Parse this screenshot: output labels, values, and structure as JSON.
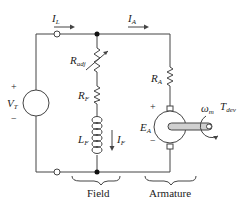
{
  "diagram": {
    "type": "circuit",
    "labels": {
      "line_current": {
        "main": "I",
        "sub": "L"
      },
      "armature_current": {
        "main": "I",
        "sub": "A"
      },
      "terminal_voltage": {
        "main": "V",
        "sub": "T"
      },
      "adj_resistor": {
        "main": "R",
        "sub": "adj"
      },
      "field_resistor": {
        "main": "R",
        "sub": "F"
      },
      "field_inductor": {
        "main": "L",
        "sub": "F"
      },
      "field_current": {
        "main": "I",
        "sub": "F"
      },
      "armature_resistor": {
        "main": "R",
        "sub": "A"
      },
      "back_emf": {
        "main": "E",
        "sub": "A"
      },
      "speed": {
        "main": "ω",
        "sub": "m"
      },
      "torque": {
        "main": "T",
        "sub": "dev"
      },
      "plus": "+",
      "minus": "−",
      "field_group": "Field",
      "armature_group": "Armature"
    },
    "colors": {
      "wire": "#444444",
      "text": "#222222",
      "shaft": "#d0d0d0"
    }
  }
}
